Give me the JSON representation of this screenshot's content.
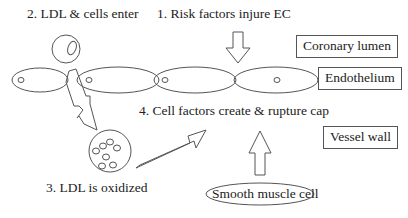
{
  "diagram": {
    "steps": [
      {
        "id": 1,
        "label": "1. Risk factors injure EC"
      },
      {
        "id": 2,
        "label": "2. LDL & cells enter"
      },
      {
        "id": 3,
        "label": "3. LDL is oxidized"
      },
      {
        "id": 4,
        "label": "4. Cell factors create & rupture cap"
      }
    ],
    "regions": [
      {
        "label": "Coronary lumen"
      },
      {
        "label": "Endothelium"
      },
      {
        "label": "Vessel wall"
      }
    ],
    "smooth_muscle_cell": {
      "label": "Smooth muscle cell"
    },
    "colors": {
      "stroke": "#555555",
      "text": "#222222",
      "background": "#ffffff"
    }
  }
}
